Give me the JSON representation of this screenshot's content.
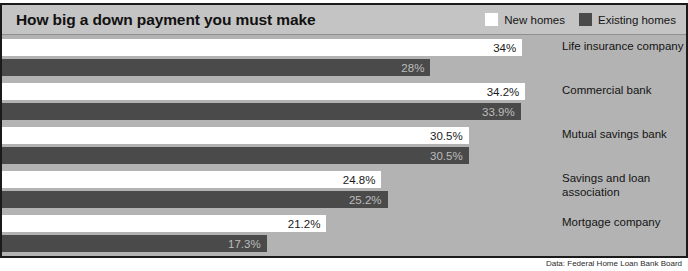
{
  "header": {
    "title": "How big a down payment you must make"
  },
  "legend": {
    "items": [
      {
        "label": "New homes",
        "swatch": "new-homes-swatch",
        "color": "#ffffff"
      },
      {
        "label": "Existing homes",
        "swatch": "existing-homes-swatch",
        "color": "#4a4a4a"
      }
    ]
  },
  "source": {
    "note": "Data: Federal Home Loan Bank Board"
  },
  "colors": {
    "background": "#b3b3b3",
    "header_background": "#c4c4c4",
    "new_homes": "#ffffff",
    "existing_homes": "#4a4a4a",
    "border": "#1a1a1a",
    "text": "#131313"
  },
  "chart_data": {
    "type": "bar",
    "title": "How big a down payment you must make",
    "subtitle": "",
    "xlabel": "",
    "ylabel": "",
    "orientation": "horizontal",
    "grid": false,
    "legend_position": "top-right",
    "xlim": [
      0,
      34.2
    ],
    "value_unit": "%",
    "categories": [
      "Life insurance company",
      "Commercial bank",
      "Mutual savings bank",
      "Savings and loan association",
      "Mortgage company"
    ],
    "series": [
      {
        "name": "New homes",
        "color": "#ffffff",
        "values": [
          34,
          34.2,
          30.5,
          24.8,
          21.2
        ],
        "labels": [
          "34%",
          "34.2%",
          "30.5%",
          "24.8%",
          "21.2%"
        ]
      },
      {
        "name": "Existing homes",
        "color": "#4a4a4a",
        "values": [
          28,
          33.9,
          30.5,
          25.2,
          17.3
        ],
        "labels": [
          "28%",
          "33.9%",
          "30.5%",
          "25.2%",
          "17.3%"
        ]
      }
    ]
  }
}
